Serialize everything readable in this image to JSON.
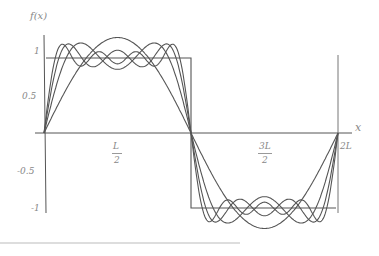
{
  "chart_data": {
    "type": "line",
    "title": "",
    "xlabel": "x",
    "ylabel": "f(x)",
    "x_ticks": [
      "L/2",
      "3L/2",
      "2L"
    ],
    "y_ticks": [
      "1",
      "0.5",
      "-0.5",
      "-1"
    ],
    "xlim": [
      0,
      "2L"
    ],
    "ylim": [
      -1.15,
      1.15
    ],
    "grid": false,
    "legend": "none",
    "series": [
      {
        "name": "square wave",
        "description": "f(x)=1 on (0,L), -1 on (L,2L)"
      },
      {
        "name": "Fourier partial sum, 1 term",
        "terms": 1
      },
      {
        "name": "Fourier partial sum, 2 terms",
        "terms": 2
      },
      {
        "name": "Fourier partial sum, 3 terms",
        "terms": 3
      },
      {
        "name": "Fourier partial sum, 4 terms",
        "terms": 4
      }
    ]
  },
  "labels": {
    "y_axis": "f(x)",
    "x_axis": "x",
    "y1": "1",
    "y05": "0.5",
    "ym05": "-0.5",
    "ym1": "-1",
    "half_num": "L",
    "half_den": "2",
    "threehalf_num": "3L",
    "threehalf_den": "2",
    "twoL": "2L"
  }
}
